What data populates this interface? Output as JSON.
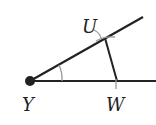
{
  "diagram": {
    "points": {
      "Y": {
        "label": "Y",
        "x": 30,
        "y": 81
      },
      "U": {
        "label": "U",
        "x": 105,
        "y": 38
      },
      "W": {
        "label": "W",
        "x": 117,
        "y": 81
      }
    },
    "colors": {
      "line": "#222222",
      "arc": "#999999",
      "background": "#ffffff"
    }
  }
}
